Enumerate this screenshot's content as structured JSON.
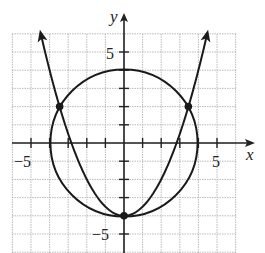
{
  "diagram": {
    "title": "",
    "axes": {
      "x_label": "x",
      "y_label": "y"
    },
    "tick_labels": {
      "x_neg": "−5",
      "x_pos": "5",
      "y_pos": "5",
      "y_neg": "−5"
    },
    "grid": {
      "x_range": [
        -6,
        6
      ],
      "y_range": [
        -6,
        5.9
      ],
      "step": 1
    },
    "curves": [
      {
        "name": "circle",
        "equation": "x^2 + y^2 = 16",
        "center": [
          0,
          0
        ],
        "radius": 4
      },
      {
        "name": "parabola",
        "equation": "y = x^2/2 - 4",
        "vertex": [
          0,
          -4
        ]
      }
    ],
    "intersection_points": [
      {
        "x": -3.46,
        "y": 2
      },
      {
        "x": 3.46,
        "y": 2
      },
      {
        "x": 0,
        "y": -4
      }
    ]
  }
}
